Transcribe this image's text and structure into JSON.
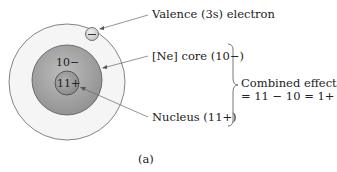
{
  "diagram": {
    "labels": {
      "valence": "Valence (3s) electron",
      "core": "[Ne] core (10−)",
      "nucleus": "Nucleus (11+)",
      "effect_line1": "Combined effect",
      "effect_line2": "= 11 − 10 = 1+",
      "caption": "(a)"
    },
    "inner_text": {
      "core_charge": "10−",
      "nucleus_charge": "11+",
      "electron_symbol": "−"
    },
    "colors": {
      "outer_shell": "#f4f4f4",
      "core": "#a8a8a8",
      "nucleus": "#9a9a9a",
      "electron": "#d6d6d6",
      "lines": "#555555"
    }
  }
}
